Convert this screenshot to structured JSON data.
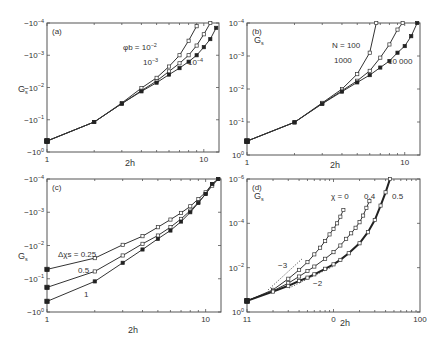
{
  "chart_data": [
    {
      "id": "a",
      "type": "line",
      "panel_label": "(a)",
      "xlabel": "2h",
      "ylabel": "G_s",
      "xscale": "log",
      "yscale": "log",
      "x_ticks": [
        "1",
        "10"
      ],
      "y_ticks": [
        "-10^0",
        "-10^-1",
        "-10^-2",
        "-10^-3",
        "-10^-4"
      ],
      "frame": {
        "x0": 47,
        "y0": 23,
        "x1": 219,
        "y1": 152
      },
      "xlim": [
        1,
        12.5
      ],
      "ylim_decades": [
        0,
        4
      ],
      "legend_title": "φb =",
      "series": [
        {
          "name": "φb = 10^-2",
          "x": [
            1,
            2,
            3,
            4,
            5,
            6,
            7,
            8,
            9
          ],
          "log_abs_y": [
            -0.34,
            -0.93,
            -1.52,
            -1.98,
            -2.3,
            -2.65,
            -3.0,
            -3.45,
            -3.9
          ]
        },
        {
          "name": "10^-3",
          "x": [
            1,
            2,
            3,
            4,
            5,
            6,
            7,
            8,
            9,
            10,
            11
          ],
          "log_abs_y": [
            -0.34,
            -0.93,
            -1.5,
            -1.9,
            -2.2,
            -2.5,
            -2.75,
            -3.0,
            -3.3,
            -3.65,
            -4.0
          ]
        },
        {
          "name": "10^-4",
          "x": [
            1,
            2,
            3,
            4,
            5,
            6,
            7,
            8,
            9,
            10,
            11,
            12
          ],
          "log_abs_y": [
            -0.34,
            -0.93,
            -1.5,
            -1.88,
            -2.15,
            -2.4,
            -2.6,
            -2.8,
            -3.0,
            -3.25,
            -3.5,
            -3.85
          ]
        }
      ],
      "annotations": [
        {
          "text": "φb = 10^-2",
          "x": 123,
          "y": 50
        },
        {
          "text": "10^-3",
          "x": 143,
          "y": 65
        },
        {
          "text": "10^-4",
          "x": 188,
          "y": 65
        }
      ]
    },
    {
      "id": "b",
      "type": "line",
      "panel_label": "(b)",
      "xlabel": "2h",
      "ylabel": "G_s",
      "xscale": "log",
      "yscale": "log",
      "x_ticks": [
        "1",
        "10"
      ],
      "y_ticks": [
        "10^0",
        "10^-1",
        "10^-2",
        "10^-3",
        "10^-4"
      ],
      "frame": {
        "x0": 247,
        "y0": 23,
        "x1": 420,
        "y1": 155
      },
      "xlim": [
        1,
        12.5
      ],
      "ylim_decades": [
        0,
        4
      ],
      "series": [
        {
          "name": "N = 100",
          "x": [
            1,
            2,
            3,
            4,
            5,
            6,
            6.6
          ],
          "log_abs_y": [
            -0.42,
            -0.99,
            -1.58,
            -2.0,
            -2.45,
            -3.1,
            -4.0
          ]
        },
        {
          "name": "1000",
          "x": [
            1,
            2,
            3,
            4,
            5,
            6,
            7,
            8,
            9,
            9.7
          ],
          "log_abs_y": [
            -0.42,
            -0.99,
            -1.56,
            -1.95,
            -2.25,
            -2.55,
            -2.95,
            -3.35,
            -3.8,
            -4.0
          ]
        },
        {
          "name": "10 000",
          "x": [
            1,
            2,
            3,
            4,
            5,
            6,
            7,
            8,
            9,
            10,
            11,
            12
          ],
          "log_abs_y": [
            -0.42,
            -0.99,
            -1.55,
            -1.92,
            -2.2,
            -2.42,
            -2.65,
            -2.85,
            -3.1,
            -3.3,
            -3.6,
            -4.0
          ]
        }
      ],
      "annotations": [
        {
          "text": "N = 100",
          "x": 332,
          "y": 48
        },
        {
          "text": "1000",
          "x": 334,
          "y": 63
        },
        {
          "text": "10 000",
          "x": 388,
          "y": 64
        },
        {
          "text": "G_s",
          "x": 254,
          "y": 43
        }
      ]
    },
    {
      "id": "c",
      "type": "line",
      "panel_label": "(c)",
      "xlabel": "2h",
      "ylabel": "G_s",
      "xscale": "log",
      "yscale": "log",
      "x_ticks": [
        "1",
        "10"
      ],
      "y_ticks": [
        "-10^0",
        "-10^-1",
        "-10^-2",
        "-10^-3",
        "-10^-4"
      ],
      "frame": {
        "x0": 47,
        "y0": 179,
        "x1": 221,
        "y1": 312
      },
      "xlim": [
        1,
        12.5
      ],
      "ylim_decades": [
        0,
        4
      ],
      "legend_title": "Δχs =",
      "series": [
        {
          "name": "Δχs = 0.25",
          "x": [
            1,
            2,
            3,
            4,
            5,
            6,
            7,
            8,
            9,
            10,
            11,
            12
          ],
          "log_abs_y": [
            -1.28,
            -1.62,
            -2.02,
            -2.28,
            -2.55,
            -2.78,
            -2.98,
            -3.18,
            -3.4,
            -3.6,
            -3.85,
            -4.0
          ]
        },
        {
          "name": "0.5",
          "x": [
            1,
            2,
            3,
            4,
            5,
            6,
            7,
            8,
            9,
            10,
            11,
            12
          ],
          "log_abs_y": [
            -0.74,
            -1.22,
            -1.7,
            -2.05,
            -2.3,
            -2.55,
            -2.8,
            -3.05,
            -3.3,
            -3.55,
            -3.8,
            -4.0
          ]
        },
        {
          "name": "1",
          "x": [
            1,
            2,
            3,
            4,
            5,
            6,
            7,
            8,
            9,
            10,
            11,
            12
          ],
          "log_abs_y": [
            -0.32,
            -0.92,
            -1.48,
            -1.88,
            -2.2,
            -2.45,
            -2.72,
            -3.0,
            -3.28,
            -3.55,
            -3.85,
            -4.0
          ]
        }
      ],
      "annotations": [
        {
          "text": "Δχs = 0.25",
          "x": 58,
          "y": 257
        },
        {
          "text": "0.5",
          "x": 78,
          "y": 273
        },
        {
          "text": "1",
          "x": 84,
          "y": 297
        }
      ]
    },
    {
      "id": "d",
      "type": "line",
      "panel_label": "(d)",
      "xlabel": "2h",
      "ylabel": "G_s",
      "xscale": "log",
      "yscale": "log",
      "x_ticks": [
        "11",
        "0",
        "100"
      ],
      "y_ticks": [
        "10^0",
        "10^-2",
        "10^-4",
        "10^-6"
      ],
      "frame": {
        "x0": 247,
        "y0": 179,
        "x1": 420,
        "y1": 312
      },
      "xlim": [
        1,
        100
      ],
      "ylim_decades": [
        0,
        6
      ],
      "series": [
        {
          "name": "χ = 0",
          "x": [
            1,
            2,
            3,
            4,
            5,
            6,
            7,
            8,
            9,
            10,
            11,
            12,
            13
          ],
          "log_abs_y": [
            -0.5,
            -1.0,
            -1.5,
            -1.9,
            -2.25,
            -2.6,
            -2.9,
            -3.2,
            -3.5,
            -3.75,
            -4.0,
            -4.3,
            -4.6
          ]
        },
        {
          "name": "0.4",
          "x": [
            1,
            2,
            3,
            4,
            5,
            6,
            8,
            10,
            12,
            14,
            16,
            18,
            20,
            22,
            24,
            26
          ],
          "log_abs_y": [
            -0.5,
            -0.95,
            -1.3,
            -1.6,
            -1.85,
            -2.05,
            -2.4,
            -2.7,
            -3.0,
            -3.3,
            -3.55,
            -3.8,
            -4.05,
            -4.35,
            -4.7,
            -5.0
          ]
        },
        {
          "name": "0.5",
          "x": [
            1,
            2,
            3,
            4,
            5,
            6,
            8,
            10,
            12,
            15,
            20,
            25,
            30,
            35,
            40,
            45
          ],
          "log_abs_y": [
            -0.5,
            -0.92,
            -1.18,
            -1.4,
            -1.55,
            -1.7,
            -1.95,
            -2.15,
            -2.35,
            -2.65,
            -3.1,
            -3.6,
            -4.15,
            -4.8,
            -5.4,
            -6.0
          ]
        }
      ],
      "guides": [
        {
          "label": "-3",
          "slope": -3,
          "from": {
            "x": 268,
            "y": 290
          },
          "to": {
            "x": 303,
            "y": 258
          },
          "label_pos": {
            "x": 278,
            "y": 268
          }
        },
        {
          "label": "-2",
          "slope": -2,
          "from": {
            "x": 289,
            "y": 288
          },
          "to": {
            "x": 334,
            "y": 266
          },
          "label_pos": {
            "x": 313,
            "y": 286
          }
        }
      ],
      "annotations": [
        {
          "text": "χ = 0",
          "x": 331,
          "y": 199
        },
        {
          "text": "0.4",
          "x": 364,
          "y": 199
        },
        {
          "text": "0.5",
          "x": 392,
          "y": 199
        },
        {
          "text": "G_s",
          "x": 254,
          "y": 199
        }
      ]
    }
  ]
}
